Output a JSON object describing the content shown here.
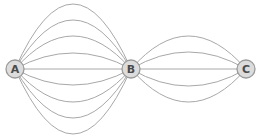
{
  "diagram": {
    "type": "multigraph",
    "nodes": [
      {
        "id": "A",
        "label": "A",
        "x": 15,
        "y": 69
      },
      {
        "id": "B",
        "label": "B",
        "x": 131,
        "y": 69
      },
      {
        "id": "C",
        "label": "C",
        "x": 246,
        "y": 69
      }
    ],
    "edges": [
      {
        "from": "A",
        "to": "B",
        "count": 9
      },
      {
        "from": "B",
        "to": "C",
        "count": 5
      }
    ],
    "colors": {
      "edge": "#a8a8a8",
      "node_fill": "#dcdcdc",
      "node_stroke": "#9a9a9a",
      "label": "#4a4a4a",
      "background": "#ffffff"
    }
  }
}
